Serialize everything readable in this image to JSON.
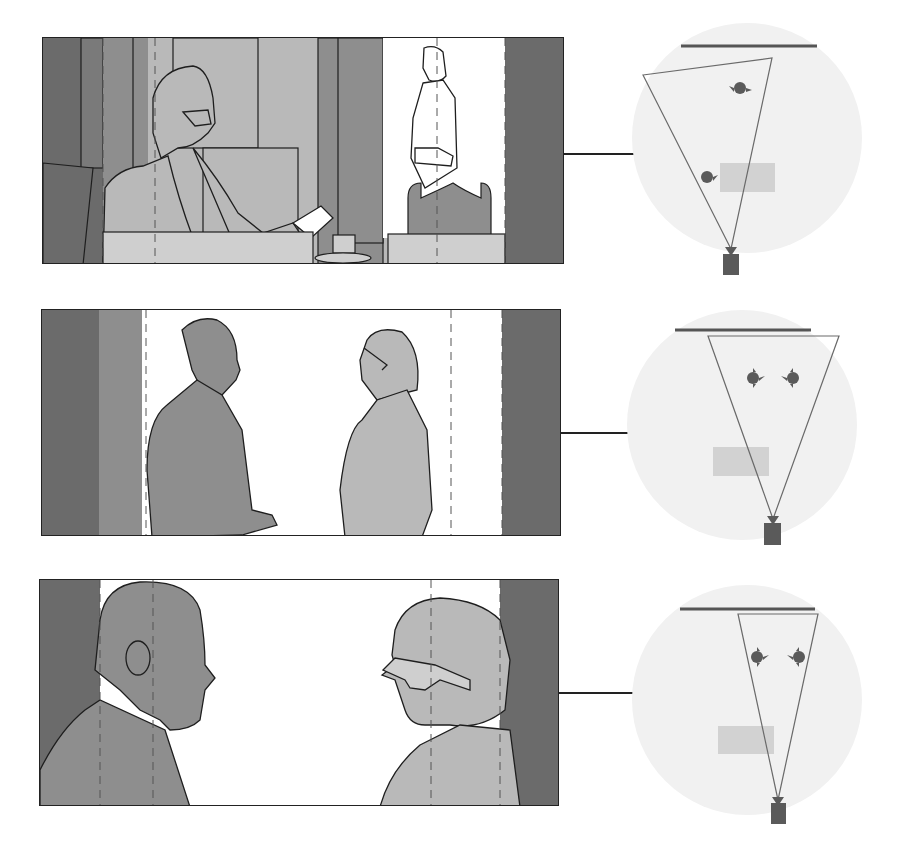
{
  "colors": {
    "dark": "#6b6b6b",
    "medium": "#8e8e8e",
    "light": "#b9b9b9",
    "lighter": "#cfcfcf",
    "white": "#ffffff",
    "outline": "#1e1e1e",
    "plan_bg": "#f1f1f1",
    "plan_table": "#d2d2d2",
    "plan_mark": "#5a5a5a",
    "plan_line": "#6a6a6a"
  },
  "shots": [
    {
      "id": "shot-1",
      "description": "Over-the-shoulder wide shot: seated man with glasses at desk, standing man in doorway",
      "frame": {
        "x": 42,
        "y": 37,
        "w": 522,
        "h": 227
      },
      "connector": {
        "x1": 563,
        "x2": 645,
        "y": 153
      },
      "plan": {
        "circle": {
          "cx": 747,
          "cy": 138,
          "r": 115
        },
        "wall": {
          "x1": 681,
          "x2": 817,
          "y": 46
        },
        "frustum": [
          [
            643,
            75
          ],
          [
            772,
            58
          ],
          [
            731,
            249
          ]
        ],
        "table": {
          "x": 720,
          "y": 163,
          "w": 55,
          "h": 29
        },
        "subjects": [
          {
            "x": 740,
            "y": 88
          },
          {
            "x": 707,
            "y": 177
          }
        ],
        "camera": {
          "x": 723,
          "y": 254,
          "w": 16,
          "h": 21
        }
      }
    },
    {
      "id": "shot-2",
      "description": "Two-shot: two men facing each other standing",
      "frame": {
        "x": 41,
        "y": 309,
        "w": 520,
        "h": 227
      },
      "connector": {
        "x1": 560,
        "x2": 643,
        "y": 432
      },
      "plan": {
        "circle": {
          "cx": 742,
          "cy": 425,
          "r": 115
        },
        "wall": {
          "x1": 675,
          "x2": 811,
          "y": 330
        },
        "frustum": [
          [
            708,
            336
          ],
          [
            839,
            336
          ],
          [
            773,
            519
          ]
        ],
        "table": {
          "x": 713,
          "y": 447,
          "w": 56,
          "h": 29
        },
        "subjects": [
          {
            "x": 753,
            "y": 378
          },
          {
            "x": 793,
            "y": 378
          }
        ],
        "camera": {
          "x": 764,
          "y": 523,
          "w": 17,
          "h": 22
        }
      }
    },
    {
      "id": "shot-3",
      "description": "Close two-shot: profiles of two men facing each other",
      "frame": {
        "x": 39,
        "y": 579,
        "w": 520,
        "h": 227
      },
      "connector": {
        "x1": 558,
        "x2": 641,
        "y": 692
      },
      "plan": {
        "circle": {
          "cx": 747,
          "cy": 700,
          "r": 115
        },
        "wall": {
          "x1": 680,
          "x2": 815,
          "y": 609
        },
        "frustum": [
          [
            738,
            614
          ],
          [
            818,
            614
          ],
          [
            778,
            800
          ]
        ],
        "table": {
          "x": 718,
          "y": 726,
          "w": 56,
          "h": 28
        },
        "subjects": [
          {
            "x": 757,
            "y": 657
          },
          {
            "x": 799,
            "y": 657
          }
        ],
        "camera": {
          "x": 771,
          "y": 803,
          "w": 15,
          "h": 21
        }
      }
    }
  ]
}
